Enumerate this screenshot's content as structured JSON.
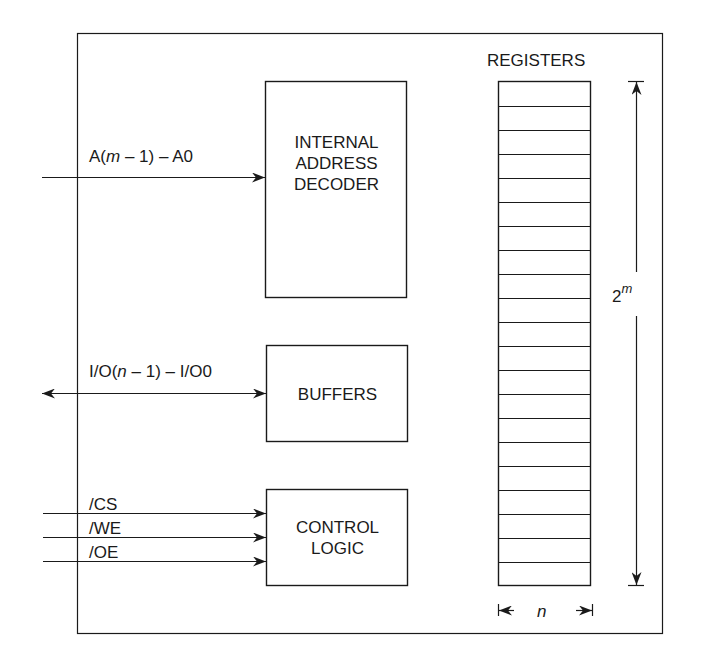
{
  "diagram": {
    "colors": {
      "line": "#1a1a1a",
      "background": "#ffffff"
    },
    "blocks": {
      "decoder": {
        "lines": [
          "INTERNAL",
          "ADDRESS",
          "DECODER"
        ]
      },
      "buffers": {
        "lines": [
          "BUFFERS"
        ]
      },
      "control": {
        "lines": [
          "CONTROL",
          "LOGIC"
        ]
      }
    },
    "registers": {
      "label": "REGISTERS",
      "row_count": 21,
      "height_label_base": "2",
      "height_label_exp": "m",
      "width_label": "n"
    },
    "signals": {
      "address": {
        "prefix": "A(",
        "var": "m",
        "suffix": " – 1) – A0",
        "direction": "in"
      },
      "data": {
        "prefix": "I/O(",
        "var": "n",
        "suffix": " – 1) – I/O0",
        "direction": "bidirectional"
      },
      "control": [
        {
          "label": "/CS",
          "direction": "in"
        },
        {
          "label": "/WE",
          "direction": "in"
        },
        {
          "label": "/OE",
          "direction": "in"
        }
      ]
    }
  }
}
